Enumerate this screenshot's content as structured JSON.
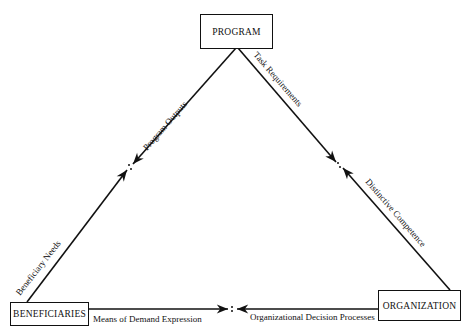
{
  "diagram": {
    "nodes": {
      "program": "PROGRAM",
      "beneficiaries": "BENEFICIARIES",
      "organization": "ORGANIZATION"
    },
    "edges": {
      "program_beneficiaries": {
        "near_program": "Program Outputs",
        "near_beneficiaries": "Beneficiary Needs"
      },
      "program_organization": {
        "near_program": "Task Requirements",
        "near_organization": "Distinctive Competence"
      },
      "beneficiaries_organization": {
        "near_beneficiaries": "Means of Demand Expression",
        "near_organization": "Organizational Decision Processes"
      }
    },
    "midpoint_symbol": ":"
  }
}
